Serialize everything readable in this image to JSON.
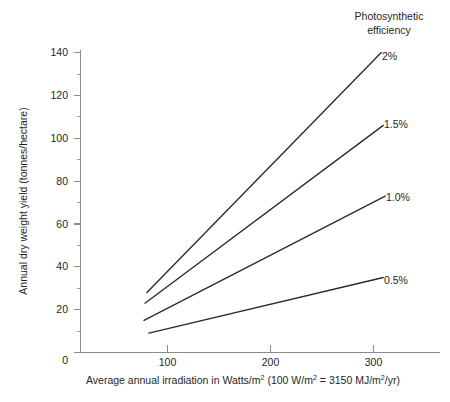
{
  "chart_data": {
    "type": "line",
    "title": "",
    "xlabel": "Average annual irradiation in Watts/m2 (100 W/m2 = 3150 MJ/m2/yr)",
    "ylabel": "Annual dry weight yield (tonnes/hectare)",
    "xlim": [
      0,
      340
    ],
    "ylim": [
      0,
      145
    ],
    "grid": false,
    "legend_position": "inline-right",
    "legend_title": "Photosynthetic efficiency",
    "xticks": [
      0,
      100,
      200,
      300
    ],
    "xticklabels": [
      "0",
      "100",
      "200",
      "300"
    ],
    "yticks": [
      0,
      20,
      40,
      60,
      80,
      100,
      120,
      140
    ],
    "yticklabels": [
      "0",
      "20",
      "40",
      "60",
      "80",
      "100",
      "120",
      "140"
    ],
    "yminorticks": [
      10,
      30,
      50,
      70,
      90,
      110,
      130
    ],
    "series": [
      {
        "name": "2%",
        "x": [
          68,
          308
        ],
        "values": [
          28,
          140
        ]
      },
      {
        "name": "1.5%",
        "x": [
          66,
          310
        ],
        "values": [
          23,
          106
        ]
      },
      {
        "name": "1.0%",
        "x": [
          65,
          312
        ],
        "values": [
          15,
          73
        ]
      },
      {
        "name": "0.5%",
        "x": [
          70,
          310
        ],
        "values": [
          9,
          35
        ]
      }
    ]
  },
  "axes": {
    "y_title": "Annual dry weight yield (tonnes/hectare)",
    "x_title_part1": "Average annual irradiation in Watts/m",
    "x_title_sup1": "2",
    "x_title_part2": " (100 W/m",
    "x_title_sup2": "2",
    "x_title_part3": " = 3150 MJ/m",
    "x_title_sup3": "2",
    "x_title_part4": "/yr)",
    "ytick_0": "0",
    "ytick_20": "20",
    "ytick_40": "40",
    "ytick_60": "60",
    "ytick_80": "80",
    "ytick_100": "100",
    "ytick_120": "120",
    "ytick_140": "140",
    "xtick_0": "0",
    "xtick_100": "100",
    "xtick_200": "200",
    "xtick_300": "300"
  },
  "legend": {
    "title_line1": "Photosynthetic",
    "title_line2": "efficiency",
    "label_2": "2%",
    "label_15": "1.5%",
    "label_10": "1.0%",
    "label_05": "0.5%"
  },
  "colors": {
    "line": "#2b2b2b",
    "axis": "#8c8c8c",
    "text": "#1f1f1f",
    "background": "#ffffff"
  }
}
